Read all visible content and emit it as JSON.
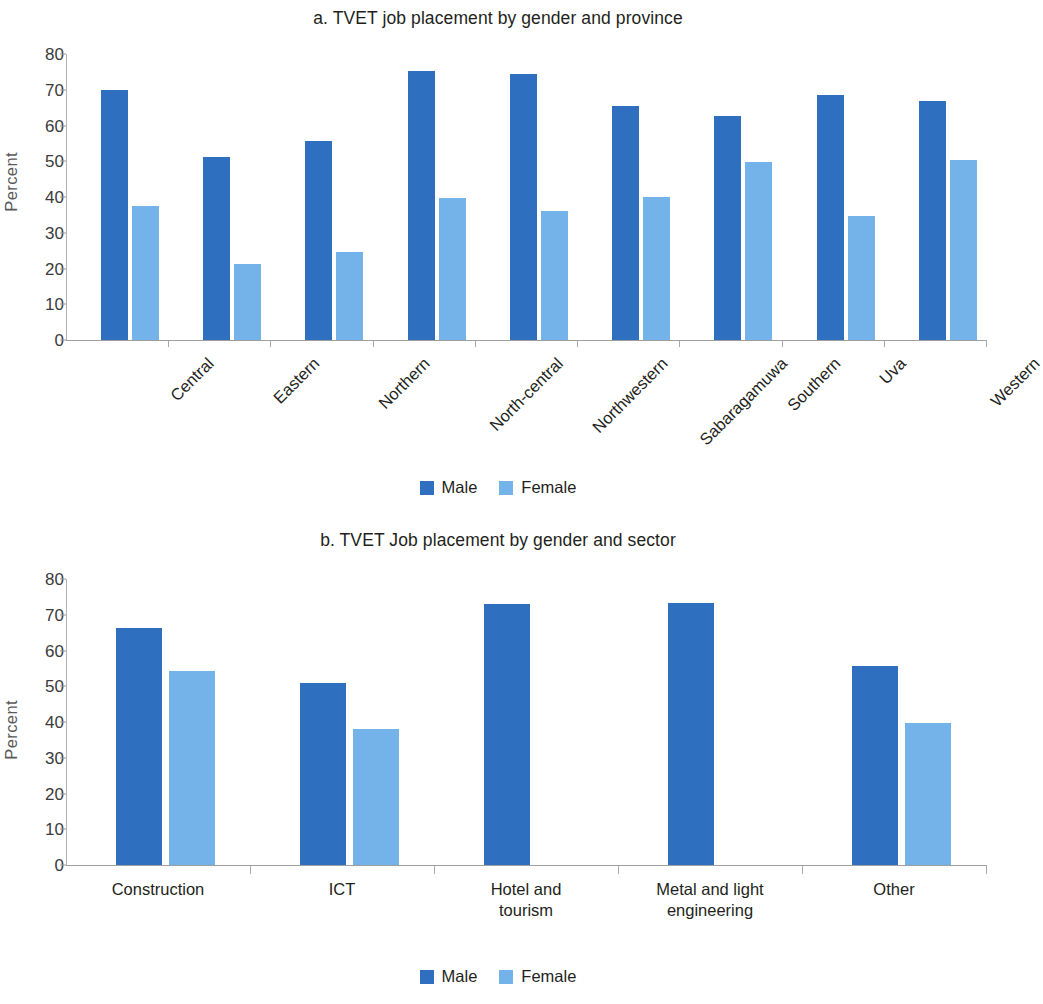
{
  "figures": [
    {
      "id": "a",
      "title": "a. TVET job placement by gender and province",
      "legend": {
        "male": "Male",
        "female": "Female"
      }
    },
    {
      "id": "b",
      "title": "b. TVET Job placement by gender and sector",
      "legend": {
        "male": "Male",
        "female": "Female"
      }
    }
  ],
  "colors": {
    "male": "#2e6fc0",
    "female": "#74b2ea",
    "axis": "#9f9f9f",
    "text": "#231f20"
  },
  "chart_data": [
    {
      "type": "bar",
      "title": "a. TVET job placement by gender and province",
      "xlabel": "",
      "ylabel": "Percent",
      "ylim": [
        0,
        80
      ],
      "yticks": [
        0,
        10,
        20,
        30,
        40,
        50,
        60,
        70,
        80
      ],
      "ytick_labels": [
        "0",
        "10",
        "20",
        "30",
        "40",
        "50",
        "60",
        "70",
        "80"
      ],
      "grid": false,
      "legend_position": "bottom",
      "categories": [
        "Central",
        "Eastern",
        "Northern",
        "North-central",
        "Northwestern",
        "Sabaragamuwa",
        "Southern",
        "Uva",
        "Western"
      ],
      "series": [
        {
          "name": "Male",
          "color": "#2e6fc0",
          "values": [
            69.8,
            51.1,
            55.7,
            75.2,
            74.4,
            65.5,
            62.8,
            68.6,
            66.8
          ]
        },
        {
          "name": "Female",
          "color": "#74b2ea",
          "values": [
            37.5,
            21.3,
            24.6,
            39.7,
            36.2,
            40.0,
            49.8,
            34.6,
            50.4
          ]
        }
      ]
    },
    {
      "type": "bar",
      "title": "b. TVET Job placement by gender and sector",
      "xlabel": "",
      "ylabel": "Percent",
      "ylim": [
        0,
        80
      ],
      "yticks": [
        0,
        10,
        20,
        30,
        40,
        50,
        60,
        70,
        80
      ],
      "ytick_labels": [
        "0",
        "10",
        "20",
        "30",
        "40",
        "50",
        "60",
        "70",
        "80"
      ],
      "grid": false,
      "legend_position": "bottom",
      "categories": [
        "Construction",
        "ICT",
        "Hotel and tourism",
        "Metal and light engineering",
        "Other"
      ],
      "category_lines": [
        [
          "Construction"
        ],
        [
          "ICT"
        ],
        [
          "Hotel and",
          "tourism"
        ],
        [
          "Metal and light",
          "engineering"
        ],
        [
          "Other"
        ]
      ],
      "series": [
        {
          "name": "Male",
          "color": "#2e6fc0",
          "values": [
            66.3,
            50.8,
            73.0,
            73.3,
            55.6
          ]
        },
        {
          "name": "Female",
          "color": "#74b2ea",
          "values": [
            54.3,
            38.0,
            null,
            null,
            39.6
          ]
        }
      ]
    }
  ]
}
